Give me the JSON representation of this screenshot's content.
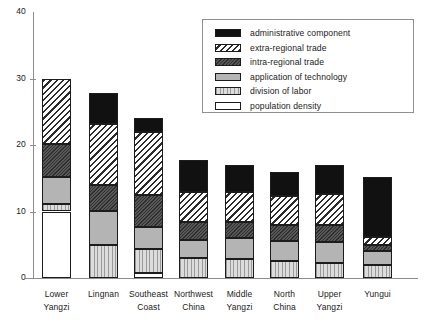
{
  "chart_data": {
    "type": "bar",
    "variant": "stacked-vertical",
    "title": "",
    "xlabel": "",
    "ylabel": "",
    "ylim": [
      0,
      40
    ],
    "yticks": [
      0,
      10,
      20,
      30,
      40
    ],
    "ytick_labels": [
      "0",
      "10",
      "20",
      "30",
      "40"
    ],
    "grid": false,
    "legend_position": "upper-right",
    "categories": [
      "Lower Yangzi",
      "Lingnan",
      "Southeast Coast",
      "Northwest China",
      "Middle Yangzi",
      "North China",
      "Upper Yangzi",
      "Yungui"
    ],
    "category_lines": [
      [
        "Lower",
        "Yangzi"
      ],
      [
        "Lingnan",
        ""
      ],
      [
        "Southeast",
        "Coast"
      ],
      [
        "Northwest",
        "China"
      ],
      [
        "Middle",
        "Yangzi"
      ],
      [
        "North",
        "China"
      ],
      [
        "Upper",
        "Yangzi"
      ],
      [
        "Yungui",
        ""
      ]
    ],
    "series": [
      {
        "name": "population density",
        "pattern": "white",
        "values": [
          10.0,
          0.0,
          0.7,
          0.0,
          0.0,
          0.0,
          0.0,
          0.0
        ]
      },
      {
        "name": "division of labor",
        "pattern": "vertical-lines-light-gray",
        "values": [
          1.1,
          5.0,
          3.6,
          3.0,
          2.8,
          2.5,
          2.2,
          2.0
        ]
      },
      {
        "name": "application of technology",
        "pattern": "medium-gray",
        "values": [
          4.1,
          5.0,
          3.3,
          2.7,
          3.2,
          3.0,
          3.2,
          2.0
        ]
      },
      {
        "name": "intra-regional trade",
        "pattern": "dark-gray",
        "values": [
          4.9,
          4.0,
          4.9,
          2.7,
          2.4,
          2.4,
          2.6,
          1.0
        ]
      },
      {
        "name": "extra-regional trade",
        "pattern": "diagonal-hatch",
        "values": [
          9.9,
          9.2,
          9.5,
          4.5,
          4.6,
          4.5,
          4.7,
          1.2
        ]
      },
      {
        "name": "administrative component",
        "pattern": "black",
        "values": [
          0.0,
          4.6,
          2.0,
          4.8,
          4.0,
          3.6,
          4.3,
          9.0
        ]
      }
    ],
    "totals": [
      30.0,
      27.8,
      24.0,
      17.7,
      17.0,
      16.0,
      17.0,
      15.2
    ]
  },
  "legend": {
    "items": [
      {
        "label": "administrative component",
        "pattern": "black"
      },
      {
        "label": "extra-regional trade",
        "pattern": "diagonal-hatch"
      },
      {
        "label": "intra-regional trade",
        "pattern": "dark-gray"
      },
      {
        "label": "application of technology",
        "pattern": "medium-gray"
      },
      {
        "label": "division of labor",
        "pattern": "vertical-lines-light-gray"
      },
      {
        "label": "population density",
        "pattern": "white"
      }
    ]
  },
  "colors": {
    "axis": "#8d8d8d",
    "outline": "#1c1c1c",
    "admin": "#111111",
    "intra": "#4a4a4a",
    "apptech": "#b4b4b4",
    "divlabor": "#d4d4d4",
    "popdens": "#ffffff"
  }
}
